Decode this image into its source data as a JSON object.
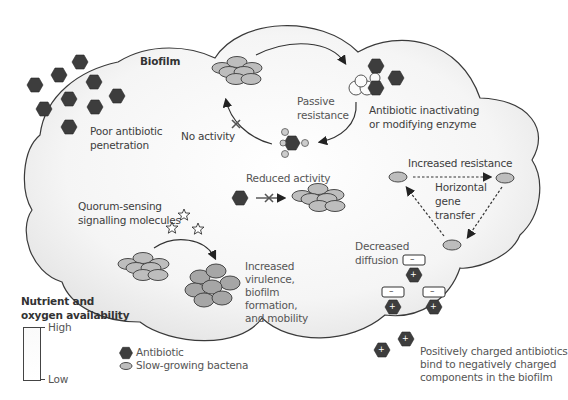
{
  "diagram": {
    "title": "Biofilm",
    "colors": {
      "antibiotic": "#3d3d3d",
      "bacteria_fill": "#bdbdbd",
      "bacteria_stroke": "#4a4a4a",
      "cloud_fill": "#f1f1f1",
      "outline": "#3a3a3a"
    },
    "labels": {
      "poor_penetration_1": "Poor antibiotic",
      "poor_penetration_2": "penetration",
      "no_activity": "No activity",
      "passive_resistance_1": "Passive",
      "passive_resistance_2": "resistance",
      "enzyme_1": "Antibiotic inactivating",
      "enzyme_2": "or modifying enzyme",
      "reduced_activity": "Reduced activity",
      "increased_resistance": "Increased resistance",
      "hgt_1": "Horizontal",
      "hgt_2": "gene",
      "hgt_3": "transfer",
      "quorum_1": "Quorum-sensing",
      "quorum_2": "signalling molecules",
      "virulence_1": "Increased",
      "virulence_2": "virulence,",
      "virulence_3": "biofilm",
      "virulence_4": "formation,",
      "virulence_5": "and mobility",
      "diffusion_1": "Decreased",
      "diffusion_2": "diffusion",
      "charged_1": "Positively charged antibiotics",
      "charged_2": "bind to negatively charged",
      "charged_3": "components in the biofilm",
      "negative_sign": "–",
      "positive_sign": "+"
    },
    "nutrient_scale": {
      "title_1": "Nutrient and",
      "title_2": "oxygen availability",
      "high": "High",
      "low": "Low"
    },
    "legend": [
      {
        "icon": "antibiotic-hexagon",
        "label": "Antibiotic"
      },
      {
        "icon": "bacteria-ellipse",
        "label": "Slow-growing bactena"
      }
    ]
  }
}
